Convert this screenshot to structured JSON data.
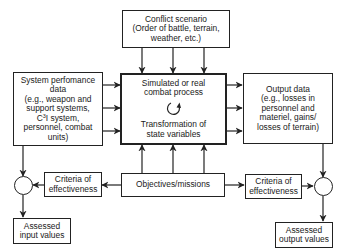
{
  "diagram": {
    "conflict_scenario": {
      "lines": [
        "Conflict scenario",
        "(Order of battle, terrain,",
        "weather, etc.)"
      ]
    },
    "system_performance": {
      "lines": [
        "System perfomance",
        "data",
        "(e.g., weapon and",
        "support systems,",
        "I system,",
        "personnel, combat",
        "units)"
      ],
      "c3_prefix": "C",
      "c3_sup": "3"
    },
    "combat_process": {
      "top_lines": [
        "Simulated or real",
        "combat process"
      ],
      "bottom_lines": [
        "Transformation of",
        "state variables"
      ],
      "icon": "cycle-arrow-icon"
    },
    "output_data": {
      "lines": [
        "Output data",
        "(e.g., losses in",
        "personnel and",
        "materiel, gains/",
        "losses of terrain)"
      ]
    },
    "objectives": {
      "label": "Objectives/missions"
    },
    "criteria_left": {
      "lines": [
        "Criteria of",
        "effectiveness"
      ]
    },
    "criteria_right": {
      "lines": [
        "Criteria of",
        "effectiveness"
      ]
    },
    "assessed_input": {
      "lines": [
        "Assessed",
        "input values"
      ]
    },
    "assessed_output": {
      "lines": [
        "Assessed",
        "output values"
      ]
    },
    "colors": {
      "line": "#222222",
      "background": "#ffffff"
    }
  }
}
